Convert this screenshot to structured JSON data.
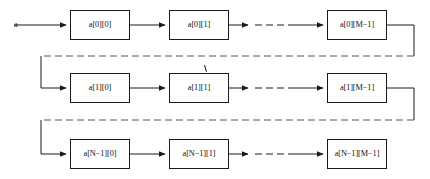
{
  "diagram": {
    "input_label": "a",
    "colors": {
      "box_border": "#1a1a1a",
      "box_fill": "#ffffff",
      "arrow": "#1a1a1a",
      "dashed_connector": "#555555",
      "background": "#ffffff"
    },
    "rows": [
      {
        "name": "row-0",
        "cells": [
          {
            "label": "a[0][0]"
          },
          {
            "label": "a[0][1]"
          },
          {
            "label": "a[0][M−1]"
          }
        ]
      },
      {
        "name": "row-1",
        "cells": [
          {
            "label": "a[1][0]"
          },
          {
            "label": "a[1][1]"
          },
          {
            "label": "a[1][M−1]"
          }
        ]
      },
      {
        "name": "row-n-1",
        "cells": [
          {
            "label": "a[N−1][0]"
          },
          {
            "label": "a[N−1][1]"
          },
          {
            "label": "a[N−1][M−1]"
          }
        ]
      }
    ],
    "connectors": {
      "input_arrow": "solid-arrow",
      "between_cells": "solid-arrow",
      "ellipsis_segment": "dashed-line",
      "row_wrap": "dashed-wrap-arrow"
    }
  }
}
